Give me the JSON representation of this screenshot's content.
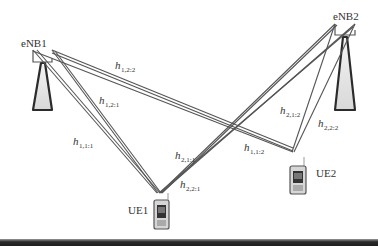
{
  "nodes": {
    "enb1": {
      "label": "eNB1"
    },
    "enb2": {
      "label": "eNB2"
    },
    "ue1": {
      "label": "UE1"
    },
    "ue2": {
      "label": "UE2"
    }
  },
  "channels": [
    {
      "id": "h_1_2_2",
      "symbol": "h",
      "subscript": "1,2:2"
    },
    {
      "id": "h_1_2_1",
      "symbol": "h",
      "subscript": "1,2:1"
    },
    {
      "id": "h_1_1_1",
      "symbol": "h",
      "subscript": "1,1:1"
    },
    {
      "id": "h_2_1_1",
      "symbol": "h",
      "subscript": "2,1:1"
    },
    {
      "id": "h_2_2_1",
      "symbol": "h",
      "subscript": "2,2:1"
    },
    {
      "id": "h_1_1_2",
      "symbol": "h",
      "subscript": "1,1:2"
    },
    {
      "id": "h_2_1_2",
      "symbol": "h",
      "subscript": "2,1:2"
    },
    {
      "id": "h_2_2_2",
      "symbol": "h",
      "subscript": "2,2:2"
    }
  ],
  "colors": {
    "line": "#555555",
    "tower_stroke": "#2b2b2b",
    "tower_fill": "#e4e4e4",
    "text": "#333333"
  }
}
